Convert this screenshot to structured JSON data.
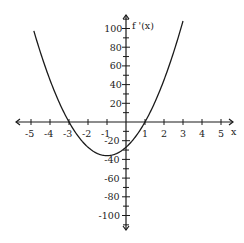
{
  "chart_data": {
    "type": "line",
    "title": "",
    "xlabel": "x",
    "ylabel": "f '(x)",
    "function": "f'(x) = 9(x+3)(x-1) = 9x^2 + 18x - 27",
    "x_ticks": [
      -5,
      -4,
      -3,
      -2,
      -1,
      1,
      2,
      3,
      4,
      5
    ],
    "y_ticks": [
      100,
      80,
      60,
      40,
      20,
      -20,
      -40,
      -60,
      -80,
      -100
    ],
    "xlim": [
      -5.5,
      5.5
    ],
    "ylim": [
      -110,
      110
    ],
    "grid": false,
    "series": [
      {
        "name": "f'(x)",
        "x": [
          -4.8,
          -4,
          -3,
          -2,
          -1,
          0,
          1,
          2,
          3
        ],
        "values": [
          104.76,
          45,
          0,
          -27,
          -36,
          -27,
          0,
          45,
          108
        ]
      }
    ],
    "roots": [
      -3,
      1
    ],
    "vertex": {
      "x": -1,
      "y": -36
    },
    "y_intercept": -27
  },
  "colors": {
    "curve": "#1a1a1a",
    "axes": "#1a1a1a"
  }
}
